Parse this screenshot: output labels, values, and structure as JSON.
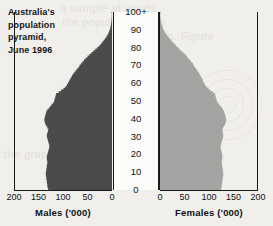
{
  "title": {
    "line1": "Australia's",
    "line2": "population",
    "line3": "pyramid,",
    "line4": "June 1996"
  },
  "background_text": {
    "g1": "a sample of words",
    "g2": "the population were",
    "g3": "shown. Figure",
    "g4": "the graph million"
  },
  "colors": {
    "male_fill": "#4a4a4a",
    "female_fill": "#a3a3a1",
    "axis": "#1a1a1a",
    "page_background": "#f0efec",
    "age_strip_background": "#fbfbfa"
  },
  "chart_data": {
    "type": "bar",
    "title": "Australia's population pyramid, June 1996",
    "subtitle": "",
    "orientation": "horizontal-pyramid",
    "xlabel": "",
    "ylabel": "Age (years)",
    "grid": false,
    "legend_position": "none",
    "age_axis": {
      "label": "Age",
      "ticks": [
        "0",
        "10",
        "20",
        "30",
        "40",
        "50",
        "60",
        "70",
        "80",
        "90",
        "100+"
      ],
      "min": 0,
      "max": 100
    },
    "male_axis": {
      "caption": "Males ('000)",
      "ticks": [
        200,
        150,
        100,
        50,
        0
      ],
      "min": 0,
      "max": 200,
      "direction": "right-to-left"
    },
    "female_axis": {
      "caption": "Females ('000)",
      "ticks": [
        0,
        50,
        100,
        150,
        200
      ],
      "min": 0,
      "max": 200,
      "direction": "left-to-right"
    },
    "ages": [
      0,
      1,
      2,
      3,
      4,
      5,
      6,
      7,
      8,
      9,
      10,
      11,
      12,
      13,
      14,
      15,
      16,
      17,
      18,
      19,
      20,
      21,
      22,
      23,
      24,
      25,
      26,
      27,
      28,
      29,
      30,
      31,
      32,
      33,
      34,
      35,
      36,
      37,
      38,
      39,
      40,
      41,
      42,
      43,
      44,
      45,
      46,
      47,
      48,
      49,
      50,
      51,
      52,
      53,
      54,
      55,
      56,
      57,
      58,
      59,
      60,
      61,
      62,
      63,
      64,
      65,
      66,
      67,
      68,
      69,
      70,
      71,
      72,
      73,
      74,
      75,
      76,
      77,
      78,
      79,
      80,
      81,
      82,
      83,
      84,
      85,
      86,
      87,
      88,
      89,
      90,
      91,
      92,
      93,
      94,
      95,
      96,
      97,
      98,
      99,
      100
    ],
    "series": [
      {
        "name": "Males ('000)",
        "color": "#4a4a4a",
        "values": [
          130,
          131,
          132,
          132,
          133,
          133,
          134,
          134,
          135,
          135,
          135,
          134,
          134,
          133,
          133,
          132,
          132,
          133,
          133,
          133,
          132,
          131,
          130,
          129,
          128,
          128,
          129,
          130,
          131,
          132,
          133,
          133,
          132,
          131,
          130,
          132,
          134,
          136,
          137,
          138,
          138,
          137,
          136,
          135,
          134,
          132,
          129,
          126,
          123,
          120,
          118,
          117,
          116,
          115,
          114,
          109,
          104,
          99,
          95,
          92,
          90,
          88,
          86,
          84,
          82,
          80,
          77,
          74,
          71,
          68,
          66,
          63,
          60,
          57,
          54,
          50,
          46,
          42,
          38,
          34,
          30,
          26,
          23,
          20,
          17,
          14,
          11.5,
          9.5,
          7.5,
          6,
          4.6,
          3.6,
          2.8,
          2.1,
          1.6,
          1.1,
          0.8,
          0.55,
          0.38,
          0.25,
          0.9
        ]
      },
      {
        "name": "Females ('000)",
        "color": "#a3a3a1",
        "values": [
          124,
          125,
          126,
          126,
          127,
          127,
          128,
          128,
          129,
          129,
          129,
          128,
          128,
          127,
          127,
          126,
          126,
          127,
          127,
          127,
          127,
          126,
          125,
          124,
          124,
          124,
          125,
          126,
          127,
          128,
          129,
          129,
          128,
          128,
          127,
          129,
          131,
          133,
          134,
          135,
          135,
          134,
          133,
          132,
          131,
          129,
          127,
          124,
          121,
          118,
          116,
          115,
          114,
          113,
          112,
          108,
          103,
          99,
          95,
          92,
          90,
          88,
          87,
          85,
          83,
          81,
          79,
          76,
          74,
          71,
          69,
          67,
          64,
          61,
          58,
          55,
          52,
          48,
          44,
          40,
          37,
          33,
          30,
          26,
          23,
          20,
          17,
          14,
          11.5,
          9.5,
          7.5,
          6,
          4.6,
          3.5,
          2.6,
          1.9,
          1.4,
          1,
          0.7,
          0.45,
          1.8
        ]
      }
    ]
  }
}
